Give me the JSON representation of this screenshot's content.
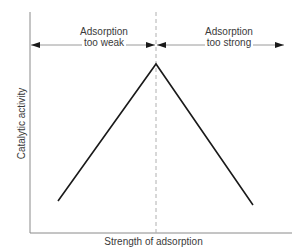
{
  "diagram": {
    "regions": [
      {
        "id": "weak",
        "label_line1": "Adsorption",
        "label_line2": "too weak"
      },
      {
        "id": "strong",
        "label_line1": "Adsorption",
        "label_line2": "too strong"
      }
    ],
    "axes": {
      "x_label": "Strength of adsorption",
      "y_label": "Catalytic activity"
    },
    "curve": {
      "shape": "volcano",
      "points": [
        [
          58,
          201
        ],
        [
          156,
          64
        ],
        [
          253,
          205
        ]
      ],
      "color": "#1a1a1a"
    },
    "colors": {
      "axis": "#888888",
      "text": "#3a3a3a",
      "dashed": "#aaaaaa",
      "arrow": "#1a1a1a"
    }
  }
}
